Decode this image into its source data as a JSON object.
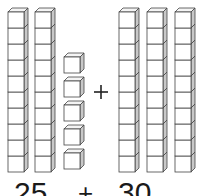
{
  "diagram": {
    "type": "base-ten-blocks-addition",
    "left_addend": {
      "tens_rods": 2,
      "ones_cubes": 5,
      "value": 25
    },
    "operator": "+",
    "right_addend": {
      "tens_rods": 3,
      "ones_cubes": 0,
      "value": 30
    },
    "cubes_per_rod": 10
  },
  "labels": {
    "left_number": "25",
    "plus": "+",
    "right_number": "30"
  },
  "colors": {
    "stroke": "#444444",
    "front_face": "#ffffff",
    "side_face": "#c8c8c8",
    "top_face": "#f4f4f4"
  }
}
